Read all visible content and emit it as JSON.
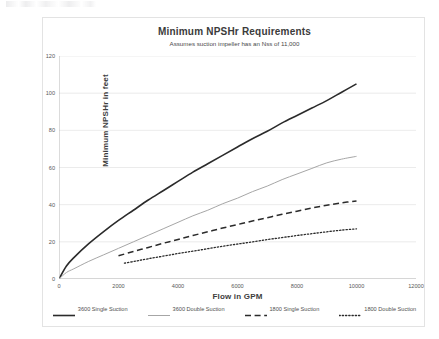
{
  "chart_data": {
    "type": "line",
    "title": "Minimum NPSHr Requirements",
    "subtitle": "Assumes suction impeller has an Nss of 11,000",
    "xlabel": "Flow in GPM",
    "ylabel": "Minimum NPSHr in feet",
    "xlim": [
      0,
      12000
    ],
    "ylim": [
      0,
      120
    ],
    "xticks": [
      "0",
      "2000",
      "4000",
      "6000",
      "8000",
      "10000",
      "12000"
    ],
    "xtick_values": [
      0,
      2000,
      4000,
      6000,
      8000,
      10000,
      12000
    ],
    "yticks": [
      "0",
      "20",
      "40",
      "60",
      "80",
      "100",
      "120"
    ],
    "ytick_values": [
      0,
      20,
      40,
      60,
      80,
      100,
      120
    ],
    "grid": "horizontal",
    "legend_position": "bottom",
    "series": [
      {
        "name": "3600 Single Suction",
        "style": "solid",
        "color": "#2b2b2b",
        "width": 1.6,
        "x": [
          0,
          250,
          500,
          1000,
          1500,
          2000,
          2500,
          3000,
          3500,
          4000,
          4500,
          5000,
          5500,
          6000,
          6500,
          7000,
          7500,
          8000,
          8500,
          9000,
          9500,
          10000
        ],
        "y": [
          0,
          7,
          11.5,
          19,
          25.5,
          31.5,
          37,
          42.5,
          47.5,
          52.5,
          57.5,
          62,
          66.5,
          71,
          75.5,
          79.5,
          84,
          88,
          92,
          96,
          100.5,
          105
        ]
      },
      {
        "name": "3600 Double Suction",
        "style": "solid",
        "color": "#a6a6a6",
        "width": 1.0,
        "x": [
          0,
          250,
          500,
          1000,
          1500,
          2000,
          2500,
          3000,
          3500,
          4000,
          4500,
          5000,
          5500,
          6000,
          6500,
          7000,
          7500,
          8000,
          8500,
          9000,
          9500,
          10000
        ],
        "y": [
          0,
          3.5,
          5.5,
          9.5,
          13,
          16.5,
          20,
          23.5,
          27,
          30.5,
          34,
          37,
          40.5,
          43.5,
          47,
          50,
          53.5,
          56.5,
          59.5,
          62.5,
          64.5,
          66
        ]
      },
      {
        "name": "1800 Single Suction",
        "style": "dashed",
        "color": "#2b2b2b",
        "width": 1.5,
        "x": [
          2000,
          2500,
          3000,
          3500,
          4000,
          4500,
          5000,
          5500,
          6000,
          6500,
          7000,
          7500,
          8000,
          8500,
          9000,
          9500,
          10000
        ],
        "y": [
          12.5,
          14.8,
          17,
          19.2,
          21.3,
          23.4,
          25.4,
          27.4,
          29.3,
          31.2,
          33,
          34.8,
          36.5,
          38.2,
          39.7,
          41,
          42
        ]
      },
      {
        "name": "1800 Double Suction",
        "style": "dotted",
        "color": "#2b2b2b",
        "width": 1.3,
        "x": [
          2200,
          2600,
          3000,
          3500,
          4000,
          4500,
          5000,
          5500,
          6000,
          6500,
          7000,
          7500,
          8000,
          8500,
          9000,
          9500,
          10000
        ],
        "y": [
          8.5,
          9.7,
          10.9,
          12.3,
          13.7,
          15.0,
          16.3,
          17.6,
          18.8,
          20.0,
          21.2,
          22.3,
          23.4,
          24.4,
          25.4,
          26.3,
          27.0
        ]
      }
    ]
  },
  "legend": {
    "items": [
      {
        "label": "3600 Single Suction"
      },
      {
        "label": "3600 Double Suction"
      },
      {
        "label": "1800 Single Suction"
      },
      {
        "label": "1800 Double Suction"
      }
    ]
  },
  "colors": {
    "grid": "#e6e6e6",
    "axis": "#b0b0b0",
    "dark_line": "#2b2b2b",
    "light_line": "#a6a6a6",
    "frame": "#e3e3e3"
  }
}
